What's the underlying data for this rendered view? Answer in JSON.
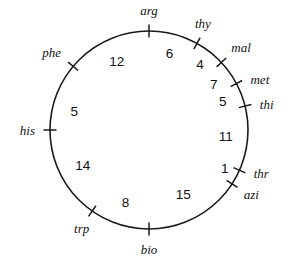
{
  "figure": {
    "background_color": "#ffffff",
    "line_color": "#1a1a1a",
    "text_color": "#111111"
  },
  "chart_data": {
    "type": "scatter",
    "subtitle": "",
    "xlabel": "",
    "ylabel": "",
    "grid": false,
    "legend": "none",
    "geometry": {
      "center_x": 149,
      "center_y": 130,
      "radius": 99,
      "units": "map units (minutes)"
    },
    "loci": [
      {
        "name": "arg",
        "angle_deg": -90,
        "label_anchor": "middle",
        "label_dx": 0,
        "label_dy": -8
      },
      {
        "name": "thy",
        "angle_deg": -61,
        "label_anchor": "middle",
        "label_dx": 2,
        "label_dy": -8
      },
      {
        "name": "mal",
        "angle_deg": -43,
        "label_anchor": "start",
        "label_dx": 4,
        "label_dy": -5
      },
      {
        "name": "met",
        "angle_deg": -28,
        "label_anchor": "start",
        "label_dx": 7,
        "label_dy": 4
      },
      {
        "name": "thi",
        "angle_deg": -14,
        "label_anchor": "start",
        "label_dx": 7,
        "label_dy": 5
      },
      {
        "name": "thr",
        "angle_deg": 24,
        "label_anchor": "start",
        "label_dx": 7,
        "label_dy": 4
      },
      {
        "name": "azi",
        "angle_deg": 33,
        "label_anchor": "start",
        "label_dx": 5,
        "label_dy": 11
      },
      {
        "name": "bio",
        "angle_deg": 90,
        "label_anchor": "middle",
        "label_dx": 0,
        "label_dy": 17
      },
      {
        "name": "trp",
        "angle_deg": 125,
        "label_anchor": "middle",
        "label_dx": -6,
        "label_dy": 15
      },
      {
        "name": "his",
        "angle_deg": 180,
        "label_anchor": "end",
        "label_dx": -7,
        "label_dy": 5
      },
      {
        "name": "phe",
        "angle_deg": -140,
        "label_anchor": "end",
        "label_dx": -6,
        "label_dy": -4
      }
    ],
    "segments": [
      {
        "from": "arg",
        "to": "thy",
        "value": 6,
        "label": "6",
        "angle_deg": -75,
        "inset": 20
      },
      {
        "from": "thy",
        "to": "mal",
        "value": 4,
        "label": "4",
        "angle_deg": -52,
        "inset": 16
      },
      {
        "from": "mal",
        "to": "met",
        "value": 7,
        "label": "7",
        "angle_deg": -35,
        "inset": 20
      },
      {
        "from": "met",
        "to": "thi",
        "value": 5,
        "label": "5",
        "angle_deg": -21,
        "inset": 20
      },
      {
        "from": "thi",
        "to": "thr",
        "value": 11,
        "label": "11",
        "angle_deg": 5,
        "inset": 22
      },
      {
        "from": "thr",
        "to": "azi",
        "value": 1,
        "label": "1",
        "angle_deg": 27,
        "inset": 14
      },
      {
        "from": "azi",
        "to": "bio",
        "value": 15,
        "label": "15",
        "angle_deg": 62,
        "inset": 26
      },
      {
        "from": "bio",
        "to": "trp",
        "value": 8,
        "label": "8",
        "angle_deg": 108,
        "inset": 23
      },
      {
        "from": "trp",
        "to": "his",
        "value": 14,
        "label": "14",
        "angle_deg": 152,
        "inset": 24
      },
      {
        "from": "his",
        "to": "phe",
        "value": 5,
        "label": "5",
        "angle_deg": -166,
        "inset": 22
      },
      {
        "from": "phe",
        "to": "arg",
        "value": 12,
        "label": "12",
        "angle_deg": -115,
        "inset": 23
      }
    ]
  }
}
